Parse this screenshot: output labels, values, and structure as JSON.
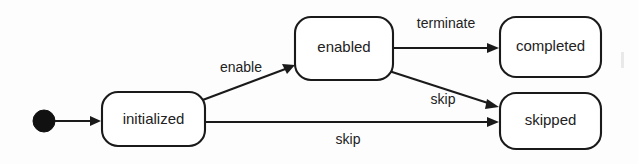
{
  "diagram": {
    "type": "uml-state-machine",
    "background_color": "#fdfdfd",
    "line_color": "#1a1a1a",
    "text_color": "#222222",
    "initial_state": {
      "name": "initial-pseudostate",
      "shape": "filled-circle",
      "cx": 44,
      "cy": 121,
      "r": 11,
      "color": "#111111"
    },
    "states": [
      {
        "id": "initialized",
        "label": "initialized",
        "x": 102,
        "y": 92,
        "width": 103,
        "height": 54,
        "rx": 16
      },
      {
        "id": "enabled",
        "label": "enabled",
        "x": 295,
        "y": 17,
        "width": 98,
        "height": 63,
        "rx": 16
      },
      {
        "id": "completed",
        "label": "completed",
        "x": 500,
        "y": 17,
        "width": 101,
        "height": 60,
        "rx": 16
      },
      {
        "id": "skipped",
        "label": "skipped",
        "x": 500,
        "y": 93,
        "width": 101,
        "height": 56,
        "rx": 16
      }
    ],
    "transitions": [
      {
        "id": "start-to-initialized",
        "label": "",
        "from": "initial-pseudostate",
        "to": "initialized",
        "points": "55,121 100,121",
        "arrow_at": {
          "x": 102,
          "y": 121,
          "dir": "right"
        }
      },
      {
        "id": "initialized-to-enabled",
        "label": "enable",
        "from": "initialized",
        "to": "enabled",
        "points": "200,101 292,67",
        "arrow_at": {
          "x": 294,
          "y": 66,
          "dir": "upright"
        },
        "label_x": 241,
        "label_y": 68
      },
      {
        "id": "enabled-to-completed",
        "label": "terminate",
        "from": "enabled",
        "to": "completed",
        "points": "393,48 496,48",
        "arrow_at": {
          "x": 499,
          "y": 48,
          "dir": "right"
        },
        "label_x": 446,
        "label_y": 24
      },
      {
        "id": "enabled-to-skipped",
        "label": "skip",
        "from": "enabled",
        "to": "skipped",
        "points": "389,72 496,106",
        "arrow_at": {
          "x": 499,
          "y": 107,
          "dir": "downright"
        },
        "label_x": 443,
        "label_y": 100
      },
      {
        "id": "initialized-to-skipped",
        "label": "skip",
        "from": "initialized",
        "to": "skipped",
        "points": "205,122 496,122",
        "arrow_at": {
          "x": 499,
          "y": 122,
          "dir": "right"
        },
        "label_x": 348,
        "label_y": 140
      }
    ]
  }
}
